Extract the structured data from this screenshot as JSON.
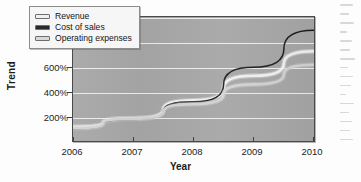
{
  "chart_data": {
    "type": "line",
    "title": "",
    "xlabel": "Year",
    "ylabel": "Trend",
    "x": [
      2006,
      2007,
      2008,
      2009,
      2010
    ],
    "categories": [
      "2006",
      "2007",
      "2008",
      "2009",
      "2010"
    ],
    "xtick_labels": [
      "2006",
      "2007",
      "2008",
      "2009",
      "2010"
    ],
    "ytick_labels": [
      "200%",
      "400%",
      "600%",
      "800%",
      "1000%"
    ],
    "ytick_values": [
      200,
      400,
      600,
      800,
      1000
    ],
    "ylim": [
      0,
      1000
    ],
    "xlim": [
      2006,
      2010
    ],
    "grid": "horizontal",
    "legend_position": "top-left-inside",
    "series": [
      {
        "name": "Revenue",
        "color": "#f0f0f0",
        "values": [
          115,
          185,
          330,
          530,
          730
        ]
      },
      {
        "name": "Cost of sales",
        "color": "#1c1c1c",
        "values": [
          100,
          175,
          320,
          600,
          900
        ]
      },
      {
        "name": "Operating expenses",
        "color": "#d2d2d2",
        "values": [
          105,
          180,
          300,
          460,
          620
        ]
      }
    ]
  },
  "legend": {
    "items": [
      {
        "label": "Revenue",
        "color": "#f0f0f0"
      },
      {
        "label": "Cost of sales",
        "color": "#2a2a2a"
      },
      {
        "label": "Operating expenses",
        "color": "#d8d8d8"
      }
    ]
  },
  "axes": {
    "y_title": "Trend",
    "x_title": "Year",
    "y_ticks": [
      "1000%",
      "800%",
      "600%",
      "400%",
      "200%"
    ],
    "x_ticks": [
      "2006",
      "2007",
      "2008",
      "2009",
      "2010"
    ]
  },
  "colors": {
    "plot_background": "#a6a6a6",
    "gridline": "#f2f2f2",
    "axis_line": "#4a4a4a",
    "text": "#1d1d1d",
    "page_background": "#fdfdfd"
  }
}
